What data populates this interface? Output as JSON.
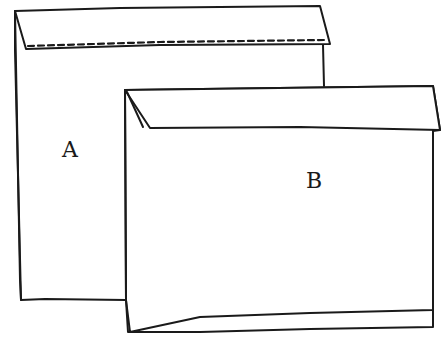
{
  "diagram": {
    "type": "line-drawing",
    "stroke_color": "#1a1a1a",
    "background": "#ffffff",
    "envelopes": [
      {
        "id": "A",
        "label": "A",
        "description": "Envelope with flap and dashed seal line"
      },
      {
        "id": "B",
        "label": "B",
        "description": "Envelope with folded flap, overlapping A"
      }
    ]
  }
}
